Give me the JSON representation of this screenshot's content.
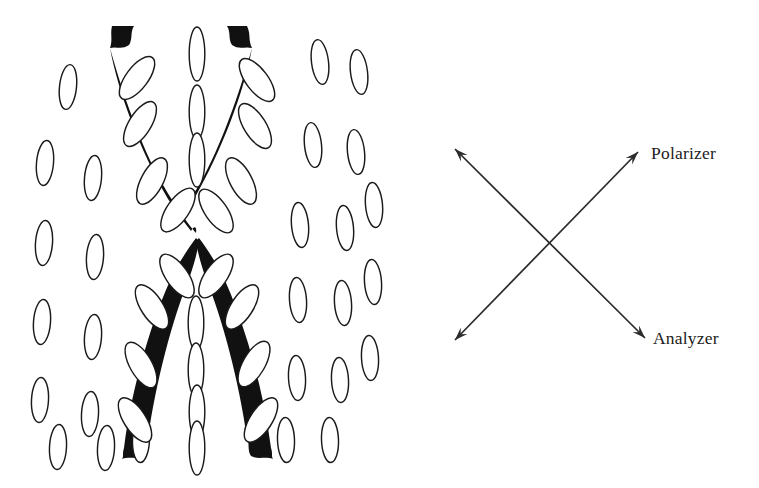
{
  "figure": {
    "kind": "schematic-diagram",
    "background_color": "#ffffff",
    "ink_color": "#111111",
    "outline_color": "#1a1a1a",
    "axis_color": "#2b2b2b",
    "width": 759,
    "height": 488
  },
  "optics": {
    "polarizer_label": "Polarizer",
    "analyzer_label": "Analyzer",
    "polarizer_axis": {
      "from_x": 455,
      "from_y": 340,
      "to_x": 638,
      "to_y": 152,
      "double_headed": true
    },
    "analyzer_axis": {
      "from_x": 455,
      "from_y": 149,
      "to_x": 645,
      "to_y": 338,
      "double_headed": true
    },
    "polarizer_label_x": 651,
    "polarizer_label_y": 159,
    "analyzer_label_x": 653,
    "analyzer_label_y": 344
  },
  "texture": {
    "brush_note": "dark extinction brushes",
    "background_ellipse_rx": 8.5,
    "background_ellipse_ry": 22.5,
    "brush_ellipse_rx": 25.5,
    "brush_ellipse_ry": 11.0,
    "center_ellipse_rx": 27.0,
    "center_ellipse_ry": 7.8,
    "background_ellipses": [
      {
        "x": 68,
        "y": 87,
        "a": 6
      },
      {
        "x": 45,
        "y": 163,
        "a": 5
      },
      {
        "x": 93,
        "y": 178,
        "a": 5
      },
      {
        "x": 44,
        "y": 243,
        "a": 4
      },
      {
        "x": 95,
        "y": 257,
        "a": 4
      },
      {
        "x": 42,
        "y": 322,
        "a": 4
      },
      {
        "x": 93,
        "y": 337,
        "a": 4
      },
      {
        "x": 40,
        "y": 400,
        "a": 3
      },
      {
        "x": 90,
        "y": 414,
        "a": 3
      },
      {
        "x": 58,
        "y": 447,
        "a": 3
      },
      {
        "x": 106,
        "y": 448,
        "a": 3
      },
      {
        "x": 141,
        "y": 440,
        "a": 2
      },
      {
        "x": 320,
        "y": 62,
        "a": -7
      },
      {
        "x": 359,
        "y": 72,
        "a": -7
      },
      {
        "x": 313,
        "y": 145,
        "a": -6
      },
      {
        "x": 356,
        "y": 152,
        "a": -6
      },
      {
        "x": 300,
        "y": 225,
        "a": -5
      },
      {
        "x": 345,
        "y": 228,
        "a": -5
      },
      {
        "x": 374,
        "y": 205,
        "a": -5
      },
      {
        "x": 298,
        "y": 300,
        "a": -4
      },
      {
        "x": 343,
        "y": 303,
        "a": -4
      },
      {
        "x": 373,
        "y": 282,
        "a": -4
      },
      {
        "x": 297,
        "y": 378,
        "a": -3
      },
      {
        "x": 340,
        "y": 380,
        "a": -3
      },
      {
        "x": 370,
        "y": 358,
        "a": -3
      },
      {
        "x": 286,
        "y": 440,
        "a": -2
      },
      {
        "x": 330,
        "y": 440,
        "a": -2
      }
    ],
    "center_ellipses": [
      {
        "x": 197,
        "y": 54,
        "a": 90
      },
      {
        "x": 197,
        "y": 112,
        "a": 90
      },
      {
        "x": 197,
        "y": 160,
        "a": 90
      },
      {
        "x": 196,
        "y": 323,
        "a": 90
      },
      {
        "x": 196,
        "y": 370,
        "a": 90
      },
      {
        "x": 197,
        "y": 412,
        "a": 90
      },
      {
        "x": 197,
        "y": 448,
        "a": 90
      }
    ],
    "left_brush_ellipses": [
      {
        "x": 137,
        "y": 78,
        "a": -53
      },
      {
        "x": 140,
        "y": 124,
        "a": -58
      },
      {
        "x": 152,
        "y": 181,
        "a": -62
      },
      {
        "x": 178,
        "y": 210,
        "a": -55
      },
      {
        "x": 177,
        "y": 276,
        "a": 55
      },
      {
        "x": 152,
        "y": 307,
        "a": 57
      },
      {
        "x": 141,
        "y": 365,
        "a": 60
      },
      {
        "x": 135,
        "y": 420,
        "a": 57
      }
    ],
    "right_brush_ellipses": [
      {
        "x": 257,
        "y": 80,
        "a": 53
      },
      {
        "x": 255,
        "y": 126,
        "a": 58
      },
      {
        "x": 241,
        "y": 181,
        "a": 62
      },
      {
        "x": 216,
        "y": 211,
        "a": 55
      },
      {
        "x": 216,
        "y": 276,
        "a": -55
      },
      {
        "x": 242,
        "y": 307,
        "a": -57
      },
      {
        "x": 254,
        "y": 364,
        "a": -60
      },
      {
        "x": 261,
        "y": 420,
        "a": -57
      }
    ]
  }
}
